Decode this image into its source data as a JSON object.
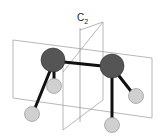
{
  "diagram": {
    "axis_label": "C",
    "axis_subscript": "2",
    "atoms": [
      {
        "role": "central-left",
        "color": "#555555"
      },
      {
        "role": "central-right",
        "color": "#555555"
      },
      {
        "role": "substituent",
        "color": "#d0d0d0"
      },
      {
        "role": "substituent",
        "color": "#d0d0d0"
      },
      {
        "role": "substituent",
        "color": "#d0d0d0"
      },
      {
        "role": "substituent",
        "color": "#d0d0d0"
      }
    ],
    "colors": {
      "plane_edge": "#888888",
      "bond": "#111111",
      "central_atom": "#555555",
      "terminal_atom": "#d0d0d0"
    }
  }
}
